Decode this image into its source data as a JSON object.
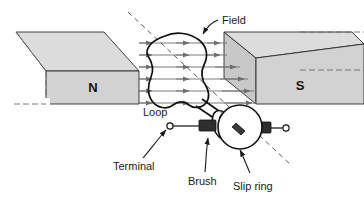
{
  "figure": {
    "type": "physics-diagram",
    "width": 364,
    "height": 206,
    "background": "#ffffff"
  },
  "colors": {
    "magnet_top_face": "#dcdcdc",
    "magnet_front_face": "#d2d2d2",
    "magnet_side_face": "#c8c8c8",
    "outline": "#2b2b2b",
    "field_line": "#6e6e6e",
    "axis_dash": "#5a5a5a",
    "brush_fill": "#2e2e2e",
    "ring_fill": "#ffffff",
    "wire": "#111111",
    "label_text": "#1a1a1a"
  },
  "magnets": {
    "north": {
      "label": "N",
      "pole": "north"
    },
    "south": {
      "label": "S",
      "pole": "south"
    }
  },
  "labels": {
    "field": "Field",
    "loop": "Loop",
    "terminal": "Terminal",
    "brush": "Brush",
    "slip_ring": "Slip ring"
  },
  "field_lines": {
    "count": 6,
    "direction": "north-to-south",
    "arrowheads_per_line": 3
  },
  "components": {
    "loop": "rotating wire loop",
    "slip_rings": 2,
    "brushes": 2,
    "terminals": 2,
    "rotation_axis": "dashed diagonal line"
  }
}
